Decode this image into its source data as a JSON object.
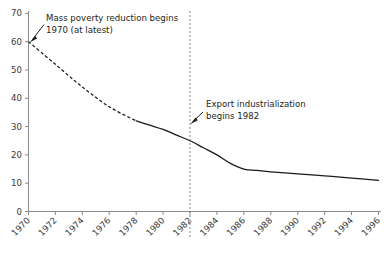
{
  "chart_data": {
    "type": "line",
    "title": "",
    "subtitle": "",
    "xlabel": "",
    "ylabel": "",
    "xlim": [
      1970,
      1996
    ],
    "ylim": [
      0,
      70
    ],
    "grid": false,
    "legend": "none",
    "x_ticks": [
      "1970",
      "1972",
      "1974",
      "1976",
      "1978",
      "1980",
      "1982",
      "1984",
      "1986",
      "1988",
      "1990",
      "1992",
      "1994",
      "1996"
    ],
    "y_ticks": [
      "0",
      "10",
      "20",
      "30",
      "40",
      "50",
      "60",
      "70"
    ],
    "series": [
      {
        "name": "Poverty rate (estimated, pre-1978)",
        "style": "dashed",
        "x": [
          1970,
          1972,
          1974,
          1976,
          1978
        ],
        "values": [
          60,
          52,
          44,
          37,
          32
        ]
      },
      {
        "name": "Poverty rate (observed)",
        "style": "solid",
        "x": [
          1978,
          1979,
          1980,
          1981,
          1982,
          1983,
          1984,
          1985,
          1986,
          1987,
          1988,
          1990,
          1992,
          1994,
          1996
        ],
        "values": [
          32,
          30.5,
          29,
          27,
          25,
          22.5,
          20,
          17,
          15,
          14.5,
          14,
          13.3,
          12.6,
          11.8,
          11
        ]
      }
    ],
    "annotations": [
      {
        "name": "mass-poverty-annotation",
        "lines": [
          "Mass poverty reduction begins",
          "1970 (at latest)"
        ],
        "text_x": 46,
        "text_y": 20,
        "arrow_from": [
          44,
          24
        ],
        "arrow_to": [
          30,
          41
        ]
      },
      {
        "name": "export-industrialization-annotation",
        "lines": [
          "Export industrialization",
          "begins 1982"
        ],
        "text_x": 205,
        "text_y": 106,
        "arrow_from": [
          202,
          112
        ],
        "arrow_to": [
          190,
          124
        ]
      }
    ],
    "event_lines": [
      {
        "name": "year-1982-marker",
        "x": 1982,
        "label": "1982"
      }
    ]
  }
}
